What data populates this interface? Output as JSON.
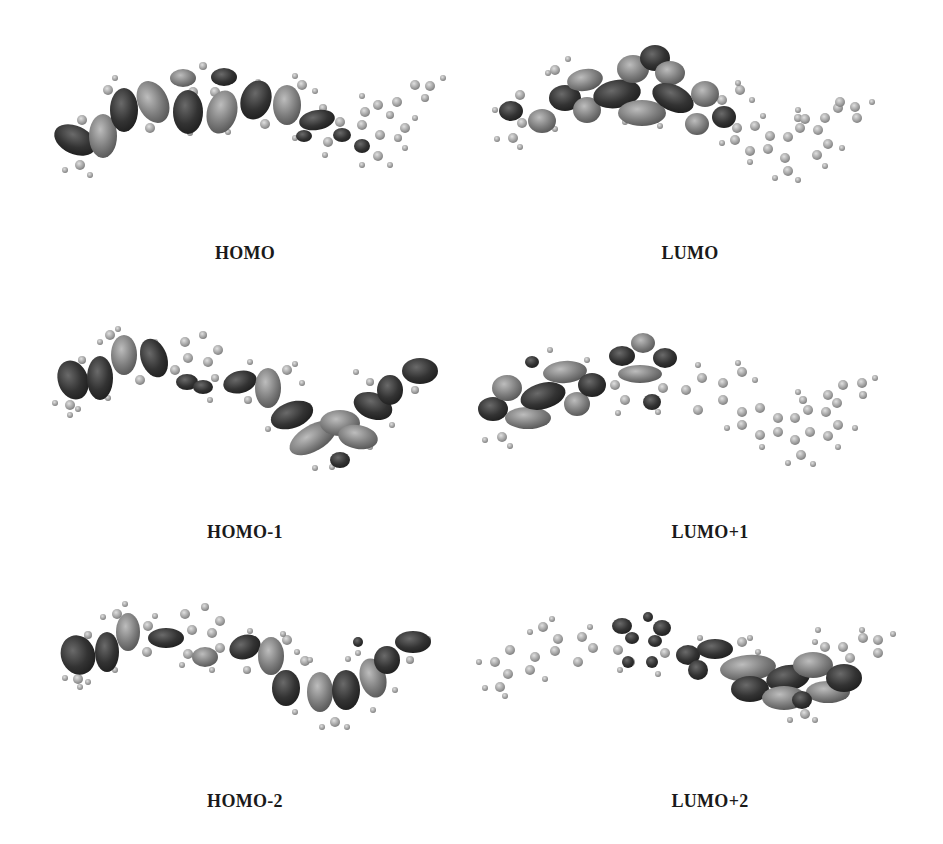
{
  "figure": {
    "panels": [
      {
        "id": "homo",
        "label": "HOMO",
        "column": "left",
        "row": 1
      },
      {
        "id": "lumo",
        "label": "LUMO",
        "column": "right",
        "row": 1
      },
      {
        "id": "homo-1",
        "label": "HOMO-1",
        "column": "left",
        "row": 2
      },
      {
        "id": "lumo+1",
        "label": "LUMO+1",
        "column": "right",
        "row": 2
      },
      {
        "id": "homo-2",
        "label": "HOMO-2",
        "column": "left",
        "row": 3
      },
      {
        "id": "lumo+2",
        "label": "LUMO+2",
        "column": "right",
        "row": 3
      }
    ],
    "colors": {
      "lobe_dark": "#3a3a3a",
      "lobe_light": "#8a8a8a",
      "atom": "#a8a8a8",
      "caption": "#1a1a1a",
      "background": "#ffffff"
    }
  }
}
